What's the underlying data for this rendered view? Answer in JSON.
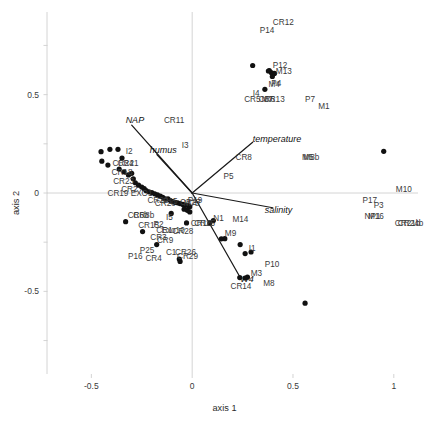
{
  "chart_data": {
    "type": "scatter",
    "title": "",
    "subtitle": "",
    "xlabel": "axis 1",
    "ylabel": "axis 2",
    "xlim": [
      -0.72,
      1.12
    ],
    "ylim": [
      -0.92,
      0.92
    ],
    "xticks": [
      -0.5,
      0,
      0.5,
      1
    ],
    "xtick_labels": [
      "-0.5",
      "0",
      "0.5",
      "1"
    ],
    "yticks": [
      -0.5,
      0,
      0.5
    ],
    "ytick_labels": [
      "-0.5",
      "0",
      "0.5"
    ],
    "minor_yticks": [
      -0.75,
      -0.25,
      0.25,
      0.75
    ],
    "grid": "zero-axis-lines-only",
    "legend": "none",
    "points": [
      {
        "label": "CR12",
        "x": 0.4,
        "y": 0.86,
        "marker": false
      },
      {
        "label": "P14",
        "x": 0.335,
        "y": 0.82,
        "marker": false
      },
      {
        "label": "P12",
        "x": 0.4,
        "y": 0.64,
        "marker": true
      },
      {
        "label": "M13",
        "x": 0.415,
        "y": 0.61,
        "marker": true
      },
      {
        "label": "M4",
        "x": 0.378,
        "y": 0.545,
        "marker": true
      },
      {
        "label": "P4",
        "x": 0.392,
        "y": 0.548,
        "marker": false
      },
      {
        "label": "I4",
        "x": 0.3,
        "y": 0.5,
        "marker": false
      },
      {
        "label": "CR5",
        "x": 0.258,
        "y": 0.47,
        "marker": false
      },
      {
        "label": "CR6",
        "x": 0.33,
        "y": 0.47,
        "marker": false
      },
      {
        "label": "M7",
        "x": 0.344,
        "y": 0.47,
        "marker": false
      },
      {
        "label": "CR13",
        "x": 0.355,
        "y": 0.47,
        "marker": false
      },
      {
        "label": "P7",
        "x": 0.56,
        "y": 0.47,
        "marker": false
      },
      {
        "label": "M1",
        "x": 0.625,
        "y": 0.43,
        "marker": false
      },
      {
        "label": "NAP",
        "x": -0.33,
        "y": 0.365,
        "marker": false,
        "env": true
      },
      {
        "label": "CR11",
        "x": -0.14,
        "y": 0.36,
        "marker": false
      },
      {
        "label": "temperature",
        "x": 0.3,
        "y": 0.27,
        "marker": false,
        "env": true
      },
      {
        "label": "I3",
        "x": -0.052,
        "y": 0.235,
        "marker": false
      },
      {
        "label": "humus",
        "x": -0.21,
        "y": 0.215,
        "marker": false,
        "env": true
      },
      {
        "label": "I2",
        "x": -0.33,
        "y": 0.205,
        "marker": false
      },
      {
        "label": "CR8",
        "x": 0.215,
        "y": 0.175,
        "marker": false
      },
      {
        "label": "M5",
        "x": 0.545,
        "y": 0.175,
        "marker": false
      },
      {
        "label": "M8b",
        "x": 0.552,
        "y": 0.175,
        "marker": false
      },
      {
        "label": "CR24",
        "x": -0.395,
        "y": 0.14,
        "marker": false
      },
      {
        "label": "CR21",
        "x": -0.37,
        "y": 0.14,
        "marker": false
      },
      {
        "label": "CR18",
        "x": -0.4,
        "y": 0.095,
        "marker": false
      },
      {
        "label": "CR23",
        "x": -0.392,
        "y": 0.052,
        "marker": false
      },
      {
        "label": "P5",
        "x": 0.155,
        "y": 0.075,
        "marker": false
      },
      {
        "label": "CR2",
        "x": -0.352,
        "y": 0.012,
        "marker": false
      },
      {
        "label": "CR19",
        "x": -0.42,
        "y": -0.008,
        "marker": false
      },
      {
        "label": "EXO1",
        "x": -0.305,
        "y": -0.012,
        "marker": false
      },
      {
        "label": "M10",
        "x": 1.01,
        "y": 0.01,
        "marker": false
      },
      {
        "label": "P19",
        "x": -0.022,
        "y": -0.045,
        "marker": false
      },
      {
        "label": "CR22",
        "x": -0.222,
        "y": -0.048,
        "marker": false
      },
      {
        "label": "P15",
        "x": -0.145,
        "y": -0.052,
        "marker": false
      },
      {
        "label": "CR20",
        "x": -0.185,
        "y": -0.06,
        "marker": false
      },
      {
        "label": "CR27",
        "x": -0.06,
        "y": -0.058,
        "marker": false
      },
      {
        "label": "M7b",
        "x": -0.042,
        "y": -0.062,
        "marker": false
      },
      {
        "label": "P17",
        "x": 0.845,
        "y": -0.045,
        "marker": false
      },
      {
        "label": "P3",
        "x": 0.9,
        "y": -0.07,
        "marker": false
      },
      {
        "label": "salinity",
        "x": 0.36,
        "y": -0.09,
        "marker": false,
        "env": true
      },
      {
        "label": "I5",
        "x": -0.13,
        "y": -0.13,
        "marker": false
      },
      {
        "label": "CR6b",
        "x": -0.32,
        "y": -0.12,
        "marker": false
      },
      {
        "label": "CR8b",
        "x": -0.292,
        "y": -0.12,
        "marker": false
      },
      {
        "label": "N1",
        "x": 0.105,
        "y": -0.135,
        "marker": true
      },
      {
        "label": "M14",
        "x": 0.2,
        "y": -0.14,
        "marker": false
      },
      {
        "label": "NP1",
        "x": 0.855,
        "y": -0.125,
        "marker": false
      },
      {
        "label": "M16",
        "x": 0.872,
        "y": -0.125,
        "marker": false
      },
      {
        "label": "CR15",
        "x": -0.268,
        "y": -0.175,
        "marker": false
      },
      {
        "label": "P2",
        "x": -0.192,
        "y": -0.168,
        "marker": false
      },
      {
        "label": "CR16",
        "x": -0.007,
        "y": -0.165,
        "marker": false
      },
      {
        "label": "CR25",
        "x": 0.01,
        "y": -0.165,
        "marker": false
      },
      {
        "label": "CR21b",
        "x": 1.005,
        "y": -0.165,
        "marker": false
      },
      {
        "label": "CR24b",
        "x": 1.02,
        "y": -0.165,
        "marker": false
      },
      {
        "label": "CR1",
        "x": -0.178,
        "y": -0.196,
        "marker": false
      },
      {
        "label": "Exo10",
        "x": -0.152,
        "y": -0.2,
        "marker": false
      },
      {
        "label": "CR28",
        "x": -0.098,
        "y": -0.205,
        "marker": false
      },
      {
        "label": "M9",
        "x": 0.162,
        "y": -0.215,
        "marker": true
      },
      {
        "label": "CR3",
        "x": -0.208,
        "y": -0.232,
        "marker": false
      },
      {
        "label": "CR9",
        "x": -0.175,
        "y": -0.248,
        "marker": false
      },
      {
        "label": "I1",
        "x": 0.28,
        "y": -0.29,
        "marker": true
      },
      {
        "label": "P25",
        "x": -0.26,
        "y": -0.3,
        "marker": false
      },
      {
        "label": "C1",
        "x": -0.13,
        "y": -0.31,
        "marker": false
      },
      {
        "label": "CR26",
        "x": -0.085,
        "y": -0.312,
        "marker": false
      },
      {
        "label": "CR29",
        "x": -0.075,
        "y": -0.33,
        "marker": false
      },
      {
        "label": "P16",
        "x": -0.318,
        "y": -0.33,
        "marker": false
      },
      {
        "label": "CR4",
        "x": -0.232,
        "y": -0.34,
        "marker": false
      },
      {
        "label": "P10",
        "x": 0.36,
        "y": -0.37,
        "marker": false
      },
      {
        "label": "W4",
        "x": 0.238,
        "y": -0.44,
        "marker": false,
        "env": true
      },
      {
        "label": "M3",
        "x": 0.29,
        "y": -0.418,
        "marker": false
      },
      {
        "label": "M8",
        "x": 0.352,
        "y": -0.47,
        "marker": false
      },
      {
        "label": "CR14",
        "x": 0.19,
        "y": -0.485,
        "marker": false
      }
    ],
    "markers_xy": [
      [
        -0.452,
        0.21
      ],
      [
        -0.408,
        0.222
      ],
      [
        -0.368,
        0.222
      ],
      [
        -0.448,
        0.162
      ],
      [
        -0.418,
        0.142
      ],
      [
        -0.348,
        0.178
      ],
      [
        -0.362,
        0.122
      ],
      [
        -0.338,
        0.108
      ],
      [
        -0.316,
        0.092
      ],
      [
        -0.3,
        0.1
      ],
      [
        -0.292,
        0.072
      ],
      [
        -0.282,
        0.052
      ],
      [
        -0.266,
        0.04
      ],
      [
        -0.25,
        0.03
      ],
      [
        -0.238,
        0.022
      ],
      [
        -0.228,
        0.012
      ],
      [
        -0.214,
        0.006
      ],
      [
        -0.2,
        0.002
      ],
      [
        -0.186,
        -0.004
      ],
      [
        -0.172,
        -0.01
      ],
      [
        -0.158,
        -0.016
      ],
      [
        -0.146,
        -0.022
      ],
      [
        -0.134,
        -0.03
      ],
      [
        -0.12,
        -0.03
      ],
      [
        -0.108,
        -0.038
      ],
      [
        -0.096,
        -0.044
      ],
      [
        -0.084,
        -0.048
      ],
      [
        -0.072,
        -0.05
      ],
      [
        -0.06,
        -0.054
      ],
      [
        -0.046,
        -0.058
      ],
      [
        -0.034,
        -0.062
      ],
      [
        -0.02,
        -0.064
      ],
      [
        -0.012,
        -0.07
      ],
      [
        -0.33,
        -0.146
      ],
      [
        -0.246,
        -0.196
      ],
      [
        -0.104,
        -0.104
      ],
      [
        -0.04,
        -0.082
      ],
      [
        -0.024,
        -0.088
      ],
      [
        -0.176,
        -0.262
      ],
      [
        -0.064,
        -0.336
      ],
      [
        -0.06,
        -0.348
      ],
      [
        0.105,
        -0.14
      ],
      [
        0.162,
        -0.232
      ],
      [
        0.238,
        -0.262
      ],
      [
        0.292,
        -0.3
      ],
      [
        0.236,
        -0.43
      ],
      [
        0.262,
        -0.432
      ],
      [
        0.274,
        -0.428
      ],
      [
        0.56,
        -0.56
      ],
      [
        0.95,
        0.212
      ],
      [
        0.3,
        0.648
      ],
      [
        0.378,
        0.62
      ],
      [
        0.392,
        0.612
      ],
      [
        0.408,
        0.608
      ],
      [
        -0.028,
        -0.152
      ],
      [
        -0.012,
        -0.096
      ]
    ],
    "env_vectors": [
      {
        "name": "NAP",
        "x": -0.3,
        "y": 0.345
      },
      {
        "name": "humus",
        "x": -0.175,
        "y": 0.195
      },
      {
        "name": "temperature",
        "x": 0.3,
        "y": 0.258
      },
      {
        "name": "salinity",
        "x": 0.4,
        "y": -0.075
      },
      {
        "name": "W4",
        "x": 0.232,
        "y": -0.418
      }
    ]
  },
  "axes": {
    "x_title": "axis 1",
    "y_title": "axis 2"
  },
  "style": {
    "marker_color": "#111111",
    "axis_line_color": "#cfcfcf",
    "vector_color": "#1a1a1a",
    "label_color": "#3a3a3a",
    "background": "#ffffff"
  }
}
